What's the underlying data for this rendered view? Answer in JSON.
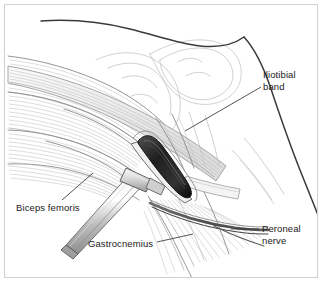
{
  "figure": {
    "kind": "anatomical-surgical-illustration",
    "background_color": "#ffffff",
    "frame": {
      "visible": true,
      "color": "#d2d2d2",
      "x": 4,
      "y": 4,
      "width": 314,
      "height": 274
    },
    "line_colors": {
      "outline_dark": "#3a3a3a",
      "outline_mid": "#8a8a8a",
      "outline_light": "#c4c4c4",
      "muscle_fiber": "#b4b4b4",
      "wound_interior": "#262626",
      "instrument_metal": "#b8b8b8",
      "label_text": "#1a1a1a",
      "leader_line": "#2b2b2b"
    },
    "labels": [
      {
        "id": "iliotibial-band",
        "lines": [
          "Iliotibial",
          "band"
        ],
        "text_x": 263,
        "text_y": 78,
        "anchor": "start",
        "leader": "M 261,87 L 185,131"
      },
      {
        "id": "biceps-femoris",
        "lines": [
          "Biceps femoris"
        ],
        "text_x": 16,
        "text_y": 211,
        "anchor": "start",
        "leader": "M 62,200 L 93,173"
      },
      {
        "id": "gastrocnemius",
        "lines": [
          "Gastrocnemius"
        ],
        "text_x": 88,
        "text_y": 247,
        "anchor": "start",
        "leader": "M 157,242 L 193,234"
      },
      {
        "id": "peroneal-nerve",
        "lines": [
          "Peroneal",
          "nerve"
        ],
        "text_x": 262,
        "text_y": 232,
        "anchor": "start",
        "leader": "M 259,229 L 231,229"
      }
    ],
    "structures": [
      {
        "id": "iliotibial-band",
        "label": "Iliotibial band",
        "kind": "fascial-band"
      },
      {
        "id": "biceps-femoris",
        "label": "Biceps femoris",
        "kind": "muscle"
      },
      {
        "id": "gastrocnemius",
        "label": "Gastrocnemius",
        "kind": "muscle"
      },
      {
        "id": "peroneal-nerve",
        "label": "Peroneal nerve",
        "kind": "nerve"
      },
      {
        "id": "femoral-condyle",
        "label": "",
        "kind": "bone"
      },
      {
        "id": "surgical-wound",
        "label": "",
        "kind": "incision-opening"
      },
      {
        "id": "retractor",
        "label": "",
        "kind": "surgical-instrument"
      }
    ]
  }
}
